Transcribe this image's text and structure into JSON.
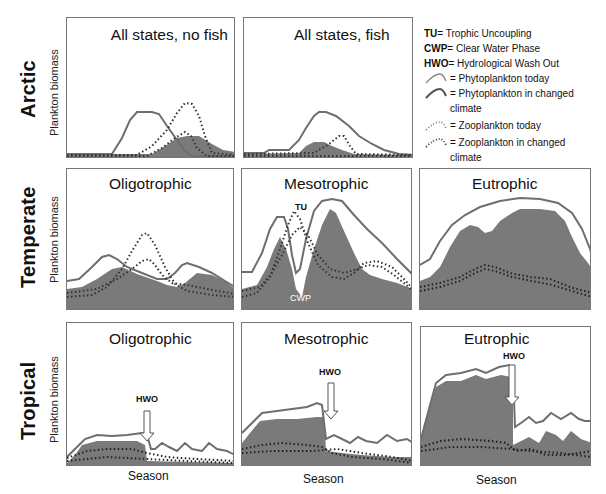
{
  "row_labels": {
    "arctic": "Arctic",
    "temperate": "Temperate",
    "tropical": "Tropical"
  },
  "y_axis_label": "Plankton biomass",
  "x_axis_label": "Season",
  "legend": {
    "abbreviations": [
      {
        "abbr": "TU",
        "text": " = Trophic Uncoupling"
      },
      {
        "abbr": "CWP",
        "text": " = Clear Water Phase"
      },
      {
        "abbr": "HWO",
        "text": " = Hydrological Wash Out"
      }
    ],
    "series": [
      {
        "symbol": "solid-line-thin",
        "text": "= Phytoplankton today"
      },
      {
        "symbol": "solid-line-thick",
        "text": "= Phytoplankton in changed climate"
      },
      {
        "symbol": "dotted-line-light",
        "text": "= Zooplankton today"
      },
      {
        "symbol": "dotted-line-dark",
        "text": "= Zooplankton in changed climate"
      }
    ]
  },
  "panels": {
    "arctic_no_fish": {
      "title": "All states, no fish"
    },
    "arctic_fish": {
      "title": "All states, fish"
    },
    "temperate_oligo": {
      "title": "Oligotrophic"
    },
    "temperate_meso": {
      "title": "Mesotrophic",
      "annotations": [
        "TU",
        "CWP"
      ]
    },
    "temperate_eu": {
      "title": "Eutrophic"
    },
    "tropical_oligo": {
      "title": "Oligotrophic",
      "annotations": [
        "HWO"
      ]
    },
    "tropical_meso": {
      "title": "Mesotrophic",
      "annotations": [
        "HWO"
      ]
    },
    "tropical_eu": {
      "title": "Eutrophic",
      "annotations": [
        "HWO"
      ]
    }
  },
  "annotations": {
    "tu": "TU",
    "cwp": "CWP",
    "hwo": "HWO"
  },
  "colors": {
    "phyto_line": "#6e6e6e",
    "fill": "#7a7a7a",
    "zoo_dots": "#333333",
    "border": "#777777"
  }
}
